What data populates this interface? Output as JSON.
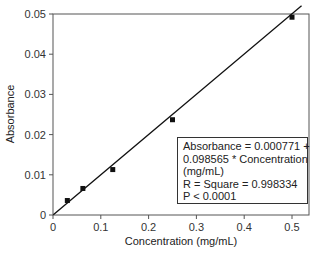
{
  "chart_data": {
    "type": "scatter",
    "title": "",
    "xlabel": "Concentration (mg/mL)",
    "ylabel": "Absorbance",
    "xlim": [
      0,
      0.55
    ],
    "ylim": [
      0,
      0.05
    ],
    "x_ticks": [
      "0",
      "0.1",
      "0.2",
      "0.3",
      "0.4",
      "0.5"
    ],
    "y_ticks": [
      "0",
      "0.01",
      "0.02",
      "0.03",
      "0.04",
      "0.05"
    ],
    "grid": false,
    "legend": null,
    "series": [
      {
        "name": "Measured",
        "marker": "square",
        "x": [
          0.03,
          0.0625,
          0.125,
          0.25,
          0.5
        ],
        "y": [
          0.0036,
          0.0066,
          0.0113,
          0.0237,
          0.0492
        ]
      },
      {
        "name": "Linear fit",
        "type": "line",
        "intercept": 0.000771,
        "slope": 0.098565
      }
    ],
    "annotation": [
      "Absorbance = 0.000771 +",
      "0.098565 * Concentration",
      "(mg/mL)",
      "R = Square = 0.998334",
      "P < 0.0001"
    ]
  }
}
